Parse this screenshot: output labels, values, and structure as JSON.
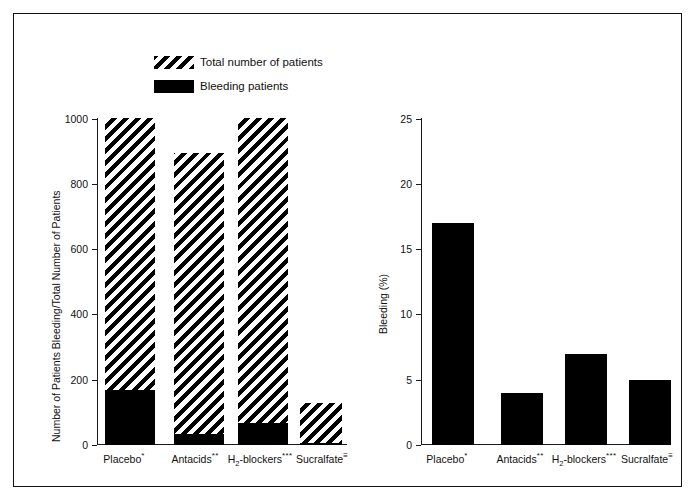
{
  "figure": {
    "frame": true,
    "background": "#ffffff",
    "ink_color": "#111111"
  },
  "legend": {
    "items": [
      {
        "label": "Total number of patients",
        "swatch": "hatched-diagonal",
        "color": "#000000"
      },
      {
        "label": "Bleeding patients",
        "swatch": "solid-black",
        "color": "#000000"
      }
    ]
  },
  "chart_data": [
    {
      "type": "bar",
      "id": "left-panel",
      "title": "",
      "xlabel": "",
      "ylabel": "Number of Patients Bleeding/Total Number of Patients",
      "ylim": [
        0,
        1000
      ],
      "yticks": [
        0,
        200,
        400,
        600,
        800,
        1000
      ],
      "ytick_labels": [
        "0",
        "200",
        "400",
        "600",
        "800",
        "1000"
      ],
      "grid": false,
      "legend_position": "top-center",
      "categories": [
        "Placebo",
        "Antacids",
        "H2-blockers",
        "Sucralfate"
      ],
      "category_marks": [
        "*",
        "**",
        "***",
        "†"
      ],
      "category_labels_html": [
        "Placebo<sup>*</sup>",
        "Antacids<sup>**</sup>",
        "H<sub>2</sub>-blockers<sup>***</sup>",
        "Sucralfate<sup>≡</sup>"
      ],
      "series": [
        {
          "name": "Total number of patients",
          "fill": "hatched-diagonal",
          "values": [
            1005,
            895,
            1005,
            130
          ]
        },
        {
          "name": "Bleeding patients",
          "fill": "solid-black",
          "values": [
            170,
            35,
            68,
            6
          ]
        }
      ]
    },
    {
      "type": "bar",
      "id": "right-panel",
      "title": "",
      "xlabel": "",
      "ylabel": "Bleeding (%)",
      "ylim": [
        0,
        25
      ],
      "yticks": [
        0,
        5,
        10,
        15,
        20,
        25
      ],
      "ytick_labels": [
        "0",
        "5",
        "10",
        "15",
        "20",
        "25"
      ],
      "grid": false,
      "legend_position": "none",
      "categories": [
        "Placebo",
        "Antacids",
        "H2-blockers",
        "Sucralfate"
      ],
      "category_labels_html": [
        "Placebo<sup>*</sup>",
        "Antacids<sup>**</sup>",
        "H<sub>2</sub>-blockers<sup>***</sup>",
        "Sucralfate<sup>≡</sup>"
      ],
      "series": [
        {
          "name": "Bleeding (%)",
          "fill": "solid-black",
          "values": [
            17,
            4,
            7,
            5
          ]
        }
      ]
    }
  ]
}
